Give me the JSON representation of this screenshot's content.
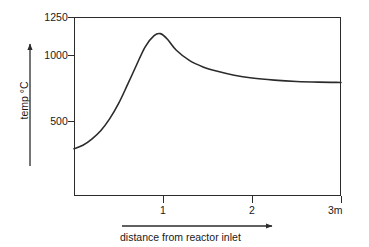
{
  "chart_data": {
    "type": "line",
    "title": "",
    "xlabel": "distance from reactor inlet",
    "ylabel": "temp °C",
    "x_unit": "m",
    "xlim": [
      0,
      3
    ],
    "ylim": [
      0,
      1250
    ],
    "grid": false,
    "legend": null,
    "x_ticks": [
      {
        "value": 1,
        "label": "1"
      },
      {
        "value": 2,
        "label": "2"
      },
      {
        "value": 3,
        "label": "3m"
      }
    ],
    "y_ticks": [
      {
        "value": 1250,
        "label": "1250"
      },
      {
        "value": 1000,
        "label": "1000"
      },
      {
        "value": 500,
        "label": "500"
      }
    ],
    "series": [
      {
        "name": "reactor temperature profile",
        "x": [
          0.0,
          0.1,
          0.2,
          0.3,
          0.4,
          0.5,
          0.6,
          0.7,
          0.8,
          0.9,
          0.97,
          1.05,
          1.15,
          1.3,
          1.45,
          1.6,
          1.8,
          2.0,
          2.25,
          2.5,
          2.75,
          3.0
        ],
        "values": [
          300,
          325,
          370,
          430,
          515,
          625,
          760,
          900,
          1035,
          1115,
          1130,
          1090,
          1010,
          935,
          890,
          860,
          830,
          810,
          795,
          785,
          780,
          778
        ]
      }
    ],
    "annotations": {
      "peak_value": 1130,
      "peak_position": 0.97,
      "inlet_value": 300,
      "outlet_value": 778
    }
  },
  "axes": {
    "y_axis_arrow": "up-arrow-icon",
    "x_axis_arrow": "right-arrow-icon"
  }
}
